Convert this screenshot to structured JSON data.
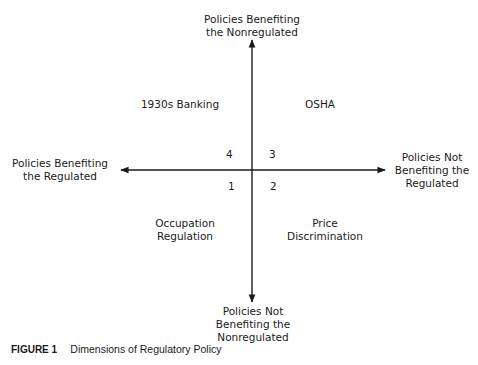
{
  "diagram": {
    "axes": {
      "top": {
        "line1": "Policies Benefiting",
        "line2": "the Nonregulated"
      },
      "bottom": {
        "line1": "Policies Not",
        "line2": "Benefiting the",
        "line3": "Nonregulated"
      },
      "left": {
        "line1": "Policies Benefiting",
        "line2": "the Regulated"
      },
      "right": {
        "line1": "Policies Not",
        "line2": "Benefiting the",
        "line3": "Regulated"
      }
    },
    "quadrants": [
      {
        "number": "1",
        "example_line1": "Occupation",
        "example_line2": "Regulation"
      },
      {
        "number": "2",
        "example_line1": "Price",
        "example_line2": "Discrimination"
      },
      {
        "number": "3",
        "example_line1": "OSHA"
      },
      {
        "number": "4",
        "example_line1": "1930s Banking"
      }
    ],
    "line_color": "#1a1a1a"
  },
  "caption": {
    "figure_label": "FIGURE 1",
    "title": "Dimensions of Regulatory Policy"
  }
}
